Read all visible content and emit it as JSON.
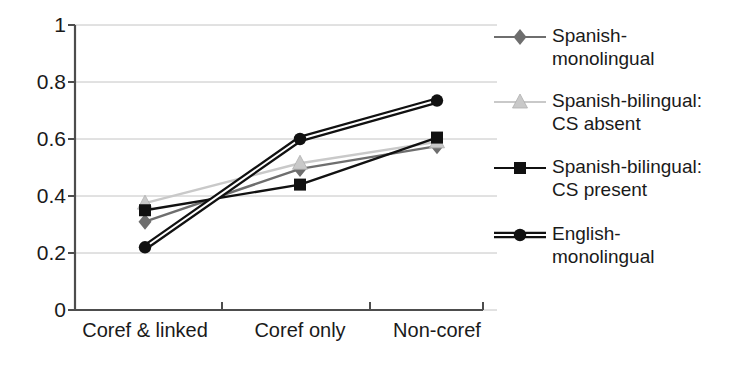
{
  "chart_data": {
    "type": "line",
    "title": "",
    "xlabel": "",
    "ylabel": "",
    "categories": [
      "Coref & linked",
      "Coref only",
      "Non-coref"
    ],
    "ylim": [
      0,
      1
    ],
    "yticks": [
      "0",
      "0.2",
      "0.4",
      "0.6",
      "0.8",
      "1"
    ],
    "ytick_values": [
      0,
      0.2,
      0.4,
      0.6,
      0.8,
      1
    ],
    "grid": true,
    "legend_position": "right",
    "series": [
      {
        "name": "Spanish-monolingual",
        "label_line1": "Spanish-",
        "label_line2": "monolingual",
        "marker": "diamond",
        "color": "#6e6e6e",
        "line_color": "#6e6e6e",
        "line_style": "single",
        "values": [
          0.31,
          0.495,
          0.575
        ]
      },
      {
        "name": "Spanish-bilingual: CS absent",
        "label_line1": "Spanish-bilingual:",
        "label_line2": "CS absent",
        "marker": "triangle",
        "color": "#c9c9c9",
        "line_color": "#c9c9c9",
        "line_style": "single",
        "values": [
          0.375,
          0.515,
          0.59
        ]
      },
      {
        "name": "Spanish-bilingual: CS present",
        "label_line1": "Spanish-bilingual:",
        "label_line2": "CS present",
        "marker": "square",
        "color": "#111111",
        "line_color": "#111111",
        "line_style": "single",
        "values": [
          0.35,
          0.44,
          0.605
        ]
      },
      {
        "name": "English-monolingual",
        "label_line1": "English-",
        "label_line2": "monolingual",
        "marker": "circle",
        "color": "#111111",
        "line_color": "#111111",
        "line_style": "double",
        "values": [
          0.22,
          0.6,
          0.735
        ]
      }
    ]
  },
  "axes": {
    "axis_color": "#4d4d4d",
    "grid_color": "#c4c4c4"
  }
}
